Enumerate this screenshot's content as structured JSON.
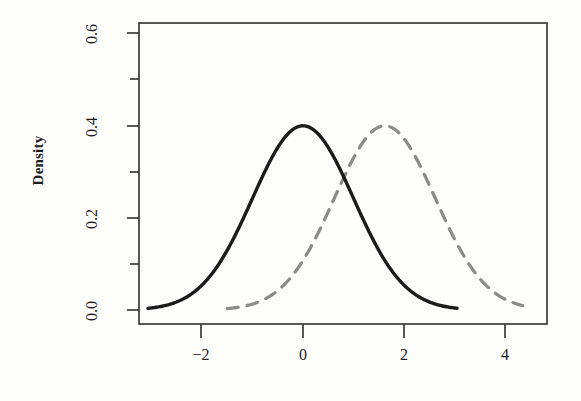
{
  "chart_data": {
    "type": "line",
    "title": "",
    "subtitle": "",
    "xlabel": "",
    "ylabel": "Density",
    "xlim": [
      -3.25,
      4.85
    ],
    "ylim": [
      -0.03,
      0.63
    ],
    "grid": false,
    "legend": "none",
    "xticks": [
      -2,
      0,
      2,
      4
    ],
    "xtick_labels": [
      "−2",
      "0",
      "2",
      "4"
    ],
    "xminor_ticks": [
      -3,
      -1,
      1,
      3
    ],
    "yticks": [
      0.0,
      0.2,
      0.4,
      0.6
    ],
    "ytick_labels": [
      "0.0",
      "0.2",
      "0.4",
      "0.6"
    ],
    "yminor_ticks": [
      0.1,
      0.3,
      0.5
    ],
    "series": [
      {
        "name": "solid-density",
        "style": "solid",
        "color": "#1b1b1b",
        "linewidth": 3.4,
        "distribution": "normal",
        "mean": 0.0,
        "sd": 1.0,
        "peak_value": 0.399,
        "peak_x": 0.0,
        "x_start": -3.07,
        "x_end": 3.05
      },
      {
        "name": "dashed-density",
        "style": "dashed",
        "color": "#8a8a8a",
        "linewidth": 3.2,
        "dash_pattern": "11 9",
        "distribution": "normal",
        "mean": 1.62,
        "sd": 1.0,
        "peak_value": 0.392,
        "peak_x": 1.62,
        "x_start": -1.5,
        "x_end": 4.35
      }
    ]
  },
  "axes": {
    "y_axis_title": "Density",
    "box_border_color": "#2b2b2b"
  }
}
